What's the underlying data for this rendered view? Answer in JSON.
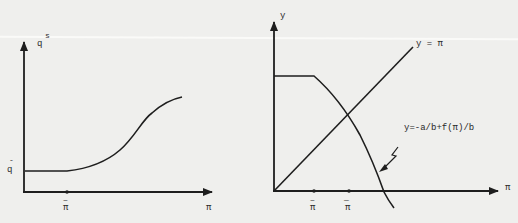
{
  "figure": {
    "left_panel": {
      "y_axis_label": "q",
      "y_axis_superscript": "s",
      "x_axis_label": "π",
      "y_level_label": "q",
      "y_level_accent": "-",
      "x_tick_label": "π",
      "x_tick_accent": "~",
      "curve_description": "supply curve flat at q-bar until π-tilde, then rising S-shape"
    },
    "right_panel": {
      "y_axis_label": "y",
      "x_axis_label": "π",
      "line_label": "y = π",
      "curve_label": "y=-a/b+f(π)/b",
      "tick1_label": "π",
      "tick1_accent": "~",
      "tick2_label": "π",
      "tick2_accent": "—",
      "arrow_annotation": "lightning-arrow pointing to curve"
    },
    "colors": {
      "background": "#efefed",
      "ink": "#1e1e1e"
    }
  }
}
